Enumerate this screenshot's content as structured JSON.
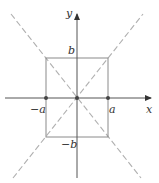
{
  "figure": {
    "colors": {
      "axis": "#555555",
      "rectangle": "#8a8a8a",
      "asymptote": "#b0b0b0",
      "point": "#444444",
      "label": "#333333"
    },
    "axes": {
      "x_label": "x",
      "y_label": "y"
    },
    "ticks": {
      "a_pos": "a",
      "a_neg": "−a",
      "b_pos": "b",
      "b_neg": "−b"
    },
    "points": [
      {
        "name": "-a",
        "x": 46,
        "y": 98
      },
      {
        "name": "origin",
        "x": 77,
        "y": 98
      },
      {
        "name": "a",
        "x": 108,
        "y": 98
      }
    ],
    "rectangle": {
      "x1": 46,
      "y1": 58,
      "x2": 108,
      "y2": 137
    },
    "asymptotes": [
      {
        "x1": 11,
        "y1": 14,
        "x2": 141,
        "y2": 178
      },
      {
        "x1": 143,
        "y1": 14,
        "x2": 13,
        "y2": 178
      }
    ]
  }
}
